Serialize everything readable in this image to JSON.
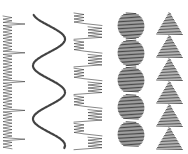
{
  "figure": {
    "background": "#ffffff",
    "ink": "#2a2a2a",
    "patterns": [
      {
        "name": "zigzag-with-long-stitches",
        "x_range": [
          3,
          25
        ],
        "y_range": [
          16,
          148
        ]
      },
      {
        "name": "sine-wave-cord",
        "x_range": [
          33,
          65
        ],
        "y_range": [
          15,
          148
        ],
        "periods": 2.5
      },
      {
        "name": "alternating-zigzag-blocks",
        "x_range": [
          74,
          106
        ],
        "y_range": [
          12,
          150
        ],
        "blocks": 10
      },
      {
        "name": "satin-bead-ovals",
        "x_range": [
          118,
          144
        ],
        "y_range": [
          12,
          148
        ],
        "beads": 5
      },
      {
        "name": "satin-triangles",
        "x_range": [
          157,
          184
        ],
        "y_range": [
          12,
          150
        ],
        "triangles": 6
      }
    ]
  }
}
